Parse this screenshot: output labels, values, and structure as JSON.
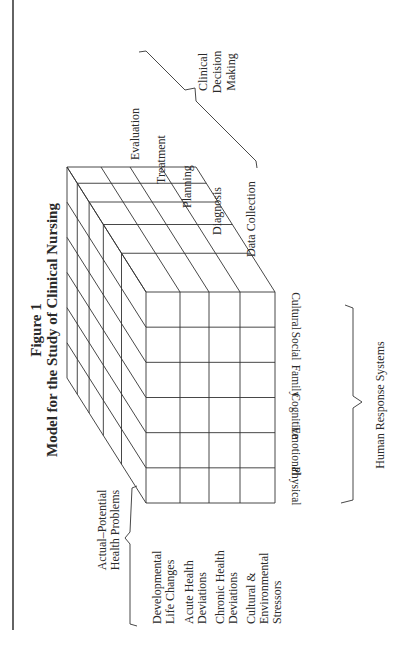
{
  "figure": {
    "number": "Figure 1",
    "title": "Model for the Study of Clinical Nursing"
  },
  "clinical_decision_making": {
    "label_lines": [
      "Clinical",
      "Decision",
      "Making"
    ],
    "stages": [
      "Evaluation",
      "Treatment",
      "Planning",
      "Diagnosis",
      "Data Collection"
    ]
  },
  "human_response_systems": {
    "label": "Human Response Systems",
    "systems": [
      "Physical",
      "Emotional",
      "Cognitive",
      "Family",
      "Social",
      "Cultural"
    ]
  },
  "health_problems": {
    "label_lines": [
      "Actual–Potential",
      "Health Problems"
    ],
    "items": [
      [
        "Developmental",
        "Life Changes"
      ],
      [
        "Acute Health",
        "Deviations"
      ],
      [
        "Chronic Health",
        "Deviations"
      ],
      [
        "Cultural &",
        "Environmental",
        "Stressors"
      ]
    ]
  },
  "colors": {
    "line": "#333333",
    "text": "#2a2a2a",
    "background": "#ffffff"
  }
}
